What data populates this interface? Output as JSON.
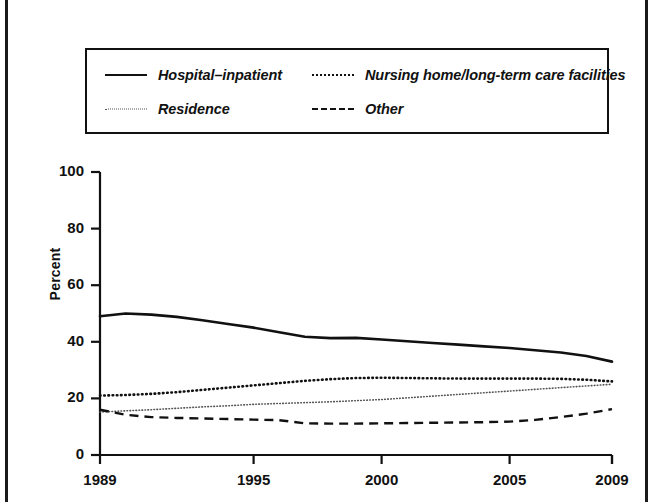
{
  "legend": {
    "items": [
      {
        "label": "Hospital–inpatient",
        "key": "solid-line-key",
        "style": "solid"
      },
      {
        "label": "Nursing home/long-term care facilities",
        "key": "dotted-line-key",
        "style": "dotted"
      },
      {
        "label": "Residence",
        "key": "fine-dotted-line-key",
        "style": "fine-dotted"
      },
      {
        "label": "Other",
        "key": "dashed-line-key",
        "style": "dashed"
      }
    ]
  },
  "chart_data": {
    "type": "line",
    "title": "",
    "xlabel": "",
    "ylabel": "Percent",
    "xlim": [
      1989,
      2009
    ],
    "ylim": [
      0,
      100
    ],
    "grid": false,
    "legend_position": "top",
    "x": [
      1989,
      1990,
      1991,
      1992,
      1993,
      1994,
      1995,
      1996,
      1997,
      1998,
      1999,
      2000,
      2001,
      2002,
      2003,
      2004,
      2005,
      2006,
      2007,
      2008,
      2009
    ],
    "xticks": [
      1989,
      1995,
      2000,
      2005,
      2009
    ],
    "xtick_labels": [
      "1989",
      "1995",
      "2000",
      "2005",
      "2009"
    ],
    "yticks": [
      0,
      20,
      40,
      60,
      80,
      100
    ],
    "ytick_labels": [
      "0",
      "20",
      "40",
      "60",
      "80",
      "100"
    ],
    "series": [
      {
        "name": "Hospital–inpatient",
        "style": "solid",
        "color": "#111111",
        "values": [
          49,
          50,
          49.6,
          48.8,
          47.6,
          46.3,
          45.0,
          43.4,
          41.8,
          41.3,
          41.4,
          40.8,
          40.2,
          39.6,
          39.0,
          38.4,
          37.8,
          37.0,
          36.2,
          35.0,
          33.0
        ]
      },
      {
        "name": "Nursing home/long-term care facilities",
        "style": "dotted",
        "color": "#111111",
        "values": [
          21.0,
          21.2,
          21.6,
          22.2,
          23.0,
          23.8,
          24.6,
          25.4,
          26.2,
          26.8,
          27.2,
          27.3,
          27.2,
          27.1,
          27.0,
          27.0,
          27.0,
          27.0,
          26.9,
          26.6,
          26.0
        ]
      },
      {
        "name": "Residence",
        "style": "fine-dotted",
        "color": "#555555",
        "values": [
          15.2,
          15.6,
          16.0,
          16.5,
          17.0,
          17.4,
          17.9,
          18.2,
          18.5,
          18.8,
          19.2,
          19.6,
          20.2,
          20.8,
          21.4,
          22.0,
          22.6,
          23.2,
          23.8,
          24.4,
          25.0
        ]
      },
      {
        "name": "Other",
        "style": "dashed",
        "color": "#111111",
        "values": [
          16.0,
          14.2,
          13.4,
          13.1,
          12.9,
          12.7,
          12.5,
          12.3,
          11.2,
          11.1,
          11.1,
          11.2,
          11.3,
          11.4,
          11.5,
          11.6,
          11.8,
          12.4,
          13.4,
          14.6,
          16.2
        ]
      }
    ]
  }
}
